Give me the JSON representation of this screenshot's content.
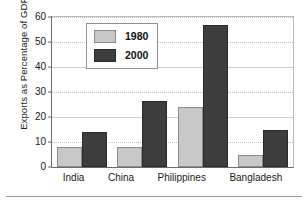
{
  "chart_data": {
    "type": "bar",
    "title": "",
    "xlabel": "",
    "ylabel": "Exports as Percentage of GDP",
    "ylim": [
      0,
      60
    ],
    "yticks": [
      0,
      10,
      20,
      30,
      40,
      50,
      60
    ],
    "grid": true,
    "legend_position": "upper-left-inside",
    "categories": [
      "India",
      "China",
      "Philippines",
      "Bangladesh"
    ],
    "series": [
      {
        "name": "1980",
        "color": "#c8c8c8",
        "values": [
          8,
          8,
          24,
          5
        ]
      },
      {
        "name": "2000",
        "color": "#3d3d3d",
        "values": [
          14,
          26.5,
          57,
          14.7
        ]
      }
    ]
  },
  "axis": {
    "y_title": "Exports as Percentage of GDP",
    "tick_labels": [
      "60",
      "50",
      "40",
      "30",
      "20",
      "10",
      "0"
    ]
  },
  "legend": {
    "entries": [
      {
        "label": "1980",
        "swatch": "legend-swatch-1980"
      },
      {
        "label": "2000",
        "swatch": "legend-swatch-2000"
      }
    ]
  },
  "categories": [
    {
      "label": "India"
    },
    {
      "label": "China"
    },
    {
      "label": "Philippines"
    },
    {
      "label": "Bangladesh"
    }
  ]
}
